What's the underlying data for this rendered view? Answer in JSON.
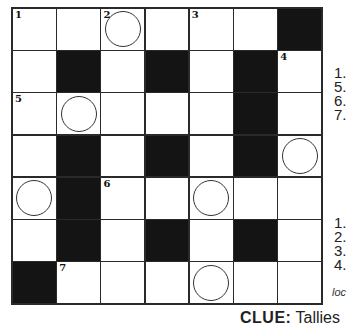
{
  "puzzle": {
    "rows": 7,
    "cols": 7,
    "grid": [
      [
        "W",
        "W",
        "W",
        "W",
        "W",
        "W",
        "B"
      ],
      [
        "W",
        "B",
        "W",
        "B",
        "W",
        "B",
        "W"
      ],
      [
        "W",
        "W",
        "W",
        "W",
        "W",
        "B",
        "W"
      ],
      [
        "W",
        "B",
        "W",
        "B",
        "W",
        "B",
        "W"
      ],
      [
        "W",
        "B",
        "W",
        "W",
        "W",
        "W",
        "W"
      ],
      [
        "W",
        "B",
        "W",
        "B",
        "W",
        "B",
        "W"
      ],
      [
        "B",
        "W",
        "W",
        "W",
        "W",
        "W",
        "W"
      ]
    ],
    "numbers": [
      {
        "r": 0,
        "c": 0,
        "n": "1"
      },
      {
        "r": 0,
        "c": 2,
        "n": "2"
      },
      {
        "r": 0,
        "c": 4,
        "n": "3"
      },
      {
        "r": 1,
        "c": 6,
        "n": "4"
      },
      {
        "r": 2,
        "c": 0,
        "n": "5"
      },
      {
        "r": 4,
        "c": 2,
        "n": "6"
      },
      {
        "r": 6,
        "c": 1,
        "n": "7"
      }
    ],
    "circles": [
      {
        "r": 0,
        "c": 2
      },
      {
        "r": 2,
        "c": 1
      },
      {
        "r": 3,
        "c": 6
      },
      {
        "r": 4,
        "c": 0
      },
      {
        "r": 4,
        "c": 4
      },
      {
        "r": 6,
        "c": 4
      }
    ]
  },
  "clues": {
    "across_numbers": [
      "1.",
      "5.",
      "6.",
      "7."
    ],
    "down_numbers": [
      "1.",
      "2.",
      "3.",
      "4."
    ],
    "partial_text": "loc"
  },
  "final_clue": {
    "label": "CLUE:",
    "text": "Tallies"
  }
}
